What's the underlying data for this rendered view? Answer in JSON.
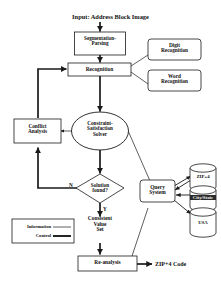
{
  "diagram": {
    "title": "Input: Address Block Image",
    "nodes": {
      "segmentation": {
        "label": "Segmentation-\nParsing",
        "shape": "rect"
      },
      "recognition": {
        "label": "Recognition",
        "shape": "rect"
      },
      "digit_recognition": {
        "label": "Digit\nRecognition",
        "shape": "rounded-rect"
      },
      "word_recognition": {
        "label": "Word\nRecognition",
        "shape": "rounded-rect"
      },
      "conflict_analysis": {
        "label": "Conflict\nAnalysis",
        "shape": "rect"
      },
      "csp_solver": {
        "label": "Constraint-\nSatisfaction\nSolver",
        "shape": "ellipse"
      },
      "solution_found": {
        "label": "Solution\nfound?",
        "shape": "diamond"
      },
      "consistent_value_set": {
        "label": "Consistent\nValue\nSet",
        "shape": "text"
      },
      "query_system": {
        "label": "Query\nSystem",
        "shape": "rounded-rect"
      },
      "re_analysis": {
        "label": "Re-analysis",
        "shape": "rect"
      }
    },
    "databases": [
      {
        "label": "ZIP+4",
        "inverted": false
      },
      {
        "label": "City/State",
        "inverted": true
      },
      {
        "label": "USA",
        "inverted": false
      }
    ],
    "edge_labels": {
      "no_branch": "N",
      "yes_branch": "Y"
    },
    "output": {
      "label": "ZIP+4 Code"
    },
    "legend": {
      "items": [
        {
          "label": "Information",
          "style": "thin"
        },
        {
          "label": "Control",
          "style": "thick"
        }
      ]
    },
    "colors": {
      "stroke": "#1a1a1a",
      "text": "#111111",
      "background": "#ffffff"
    }
  }
}
